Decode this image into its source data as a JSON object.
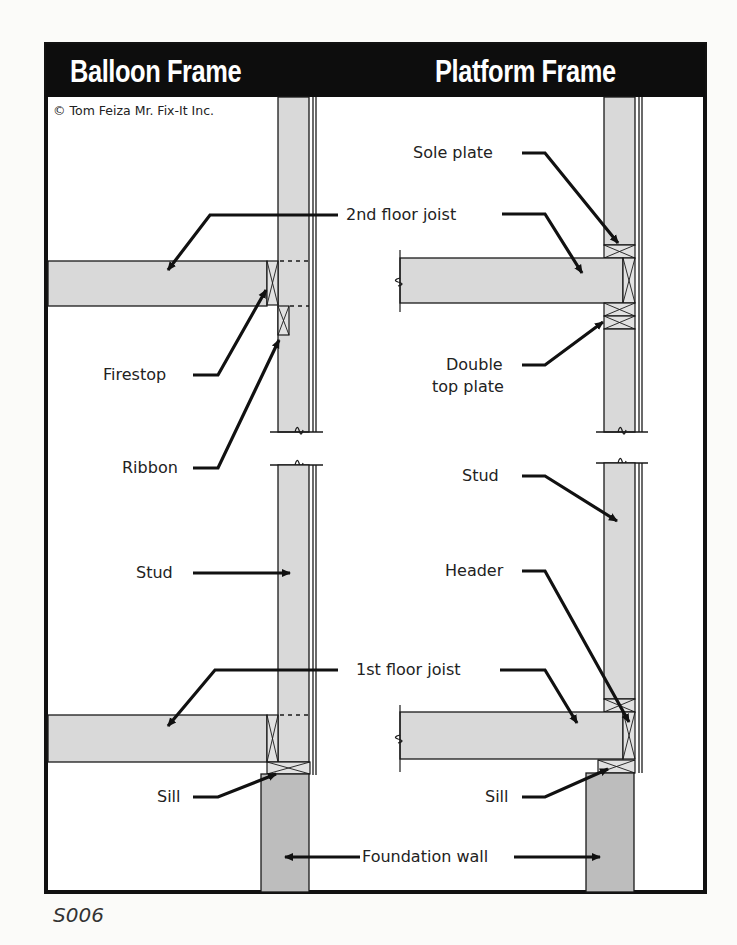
{
  "diagram": {
    "headers": {
      "left": "Balloon Frame",
      "right": "Platform Frame"
    },
    "copyright": "© Tom Feiza Mr. Fix-It Inc.",
    "figure_code": "S006",
    "labels": {
      "second_floor_joist": "2nd floor joist",
      "firestop": "Firestop",
      "ribbon": "Ribbon",
      "stud_left": "Stud",
      "first_floor_joist": "1st floor joist",
      "sill_left": "Sill",
      "sole_plate": "Sole plate",
      "double_top_plate_line1": "Double",
      "double_top_plate_line2": "top plate",
      "stud_right": "Stud",
      "header": "Header",
      "sill_right": "Sill",
      "foundation_wall": "Foundation wall"
    },
    "colors": {
      "frame_border": "#111111",
      "header_band": "#0d0d0d",
      "lumber_fill": "#d9d9d9",
      "foundation_fill": "#bdbdbd",
      "line": "#1a1a1a",
      "background": "#fbfbf9"
    }
  }
}
